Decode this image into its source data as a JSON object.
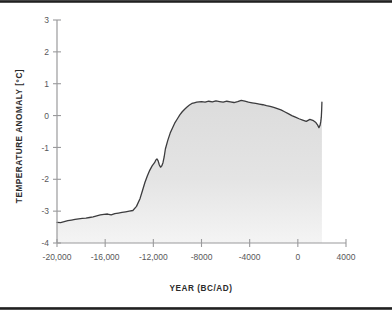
{
  "figure": {
    "name": "holocene-temperature-anomaly-chart",
    "background_color": "#ffffff",
    "frame_color": "#1d1d1d"
  },
  "axes": {
    "y_axis_title": "TEMPERATURE ANOMALY [°C]",
    "x_axis_title": "YEAR (BC/AD)",
    "y_ticks": [
      "3",
      "2",
      "1",
      "0",
      "-1",
      "-2",
      "-3",
      "-4"
    ],
    "x_ticks": [
      "-20,000",
      "-16,000",
      "-12,000",
      "-8000",
      "-4000",
      "0",
      "4000"
    ],
    "axis_line_color": "#9a9a9c",
    "tick_label_color": "#58585a"
  },
  "series_style": {
    "line_color": "#3c3c3e",
    "fill_color": "#e2e2e2",
    "line_width": "1.3"
  },
  "chart_data": {
    "type": "area",
    "title": "",
    "subtitle": "",
    "xlabel": "YEAR (BC/AD)",
    "ylabel": "TEMPERATURE ANOMALY [°C]",
    "xlim": [
      -20000,
      4000
    ],
    "ylim": [
      -4,
      3
    ],
    "xticks": [
      -20000,
      -16000,
      -12000,
      -8000,
      -4000,
      0,
      4000
    ],
    "yticks": [
      -4,
      -3,
      -2,
      -1,
      0,
      1,
      2,
      3
    ],
    "grid": false,
    "legend": null,
    "legend_position": "none",
    "annotations": [],
    "series": [
      {
        "name": "Temperature anomaly",
        "units": "°C",
        "x": [
          -20000,
          -19700,
          -19400,
          -19100,
          -18800,
          -18500,
          -18200,
          -17900,
          -17600,
          -17300,
          -17000,
          -16700,
          -16400,
          -16100,
          -15800,
          -15500,
          -15200,
          -14900,
          -14600,
          -14300,
          -14000,
          -13700,
          -13400,
          -13100,
          -12900,
          -12700,
          -12500,
          -12300,
          -12100,
          -11900,
          -11800,
          -11700,
          -11600,
          -11500,
          -11400,
          -11300,
          -11200,
          -11100,
          -11000,
          -10800,
          -10600,
          -10400,
          -10200,
          -10000,
          -9800,
          -9600,
          -9400,
          -9200,
          -9000,
          -8800,
          -8600,
          -8400,
          -8200,
          -8000,
          -7700,
          -7400,
          -7100,
          -6800,
          -6500,
          -6200,
          -5900,
          -5600,
          -5300,
          -5000,
          -4700,
          -4400,
          -4100,
          -3800,
          -3500,
          -3200,
          -2900,
          -2600,
          -2300,
          -2000,
          -1700,
          -1400,
          -1100,
          -800,
          -500,
          -200,
          100,
          400,
          700,
          1000,
          1300,
          1500,
          1650,
          1750,
          1850,
          1900,
          1950,
          1980,
          2000
        ],
        "y": [
          -3.35,
          -3.36,
          -3.33,
          -3.3,
          -3.28,
          -3.26,
          -3.24,
          -3.23,
          -3.22,
          -3.2,
          -3.18,
          -3.15,
          -3.12,
          -3.1,
          -3.09,
          -3.12,
          -3.08,
          -3.06,
          -3.04,
          -3.02,
          -3.0,
          -2.98,
          -2.85,
          -2.6,
          -2.35,
          -2.1,
          -1.9,
          -1.72,
          -1.58,
          -1.48,
          -1.4,
          -1.36,
          -1.42,
          -1.55,
          -1.62,
          -1.58,
          -1.48,
          -1.3,
          -1.05,
          -0.78,
          -0.55,
          -0.38,
          -0.22,
          -0.1,
          0.02,
          0.12,
          0.2,
          0.27,
          0.33,
          0.38,
          0.4,
          0.42,
          0.43,
          0.44,
          0.42,
          0.45,
          0.43,
          0.46,
          0.44,
          0.42,
          0.45,
          0.43,
          0.41,
          0.44,
          0.48,
          0.45,
          0.42,
          0.4,
          0.38,
          0.36,
          0.34,
          0.31,
          0.29,
          0.26,
          0.22,
          0.18,
          0.12,
          0.06,
          0.0,
          -0.05,
          -0.1,
          -0.14,
          -0.18,
          -0.12,
          -0.16,
          -0.22,
          -0.3,
          -0.38,
          -0.3,
          -0.2,
          -0.05,
          0.18,
          0.42
        ]
      }
    ]
  }
}
